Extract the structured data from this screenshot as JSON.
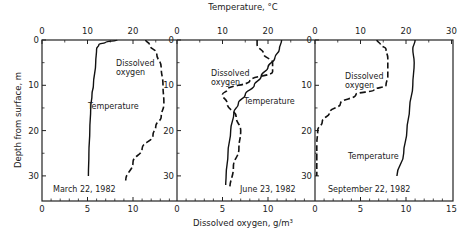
{
  "chart_data": {
    "type": "line",
    "title": "",
    "top_axis_label": "Temperature, °C",
    "bottom_axis_label": "Dissolved oxygen, g/m³",
    "ylabel": "Depth from surface, m",
    "y_ticks": [
      0,
      10,
      20,
      30
    ],
    "ylim": [
      0,
      35.5
    ],
    "y_inverted": true,
    "panels": [
      {
        "date": "March 22, 1982",
        "top_ticks": [
          "0",
          "10",
          "20"
        ],
        "bottom_ticks": [
          "0",
          "5",
          "10"
        ],
        "temperature_range": [
          0,
          30
        ],
        "oxygen_range": [
          0,
          15
        ],
        "series": [
          {
            "name": "Temperature",
            "style": "solid",
            "axis": "temperature",
            "depth": [
              0,
              0.5,
              1,
              2,
              5,
              10,
              12,
              15,
              20,
              25,
              30
            ],
            "values": [
              16.5,
              14,
              12.5,
              12,
              11.8,
              11.3,
              11,
              10.7,
              10.5,
              10.3,
              10.2
            ]
          },
          {
            "name": "Dissolved oxygen",
            "style": "dashed",
            "axis": "oxygen",
            "depth": [
              0,
              1,
              3,
              6,
              10,
              14,
              17,
              19,
              21,
              24,
              27,
              31
            ],
            "values": [
              11.4,
              11.8,
              12.6,
              13.1,
              13.3,
              13.4,
              13.1,
              12.5,
              12.2,
              11,
              10,
              9.2
            ]
          }
        ],
        "labels": [
          "Dissolved oxygen",
          "Temperature"
        ]
      },
      {
        "date": "June 23, 1982",
        "top_ticks": [
          "0",
          "10",
          "20"
        ],
        "bottom_ticks": [
          "0",
          "5",
          "10"
        ],
        "temperature_range": [
          0,
          30
        ],
        "oxygen_range": [
          0,
          15
        ],
        "series": [
          {
            "name": "Temperature",
            "style": "solid",
            "axis": "temperature",
            "depth": [
              0,
              2,
              4,
              6,
              8,
              10,
              12,
              14,
              16,
              20,
              25,
              30,
              32
            ],
            "values": [
              23,
              22.5,
              21.5,
              20,
              18.5,
              17,
              15,
              13.5,
              12.5,
              11.8,
              11.2,
              10.8,
              10.7
            ]
          },
          {
            "name": "Dissolved oxygen",
            "style": "dashed",
            "axis": "oxygen",
            "depth": [
              0,
              1,
              3,
              5,
              7,
              9,
              11,
              12,
              14,
              17,
              20,
              24,
              28,
              33
            ],
            "values": [
              8.8,
              8.8,
              9.5,
              10.5,
              10.5,
              8,
              5.5,
              5,
              5.5,
              6.5,
              7,
              6.8,
              6.2,
              5.8
            ]
          }
        ],
        "labels": [
          "Dissolved oxygen",
          "Temperature"
        ]
      },
      {
        "date": "September 22, 1982",
        "top_ticks": [
          "0",
          "10",
          "20",
          "30"
        ],
        "bottom_ticks": [
          "0",
          "5",
          "10",
          "15"
        ],
        "temperature_range": [
          0,
          30
        ],
        "oxygen_range": [
          0,
          15
        ],
        "series": [
          {
            "name": "Temperature",
            "style": "solid",
            "axis": "temperature",
            "depth": [
              0,
              2,
              5,
              10,
              15,
              20,
              25,
              30
            ],
            "values": [
              22,
              21.5,
              21.8,
              21.5,
              20.8,
              20.2,
              19.5,
              18
            ]
          },
          {
            "name": "Dissolved oxygen",
            "style": "dashed",
            "axis": "oxygen",
            "depth": [
              0,
              1,
              2,
              4,
              6,
              8,
              10,
              11,
              12,
              14,
              16,
              18,
              20,
              23,
              26,
              30
            ],
            "values": [
              6.8,
              7.2,
              7.8,
              8,
              8,
              8,
              7.8,
              6.5,
              4.5,
              2.8,
              1.6,
              0.8,
              0.3,
              0.2,
              0.2,
              0.2
            ]
          }
        ],
        "labels": [
          "Dissolved oxygen",
          "Temperature"
        ]
      }
    ],
    "legend": "none (curves labeled inline)",
    "grid": false
  },
  "texts": {
    "top_axis_label": "Temperature, °C",
    "bottom_axis_label": "Dissolved oxygen, g/m³",
    "y_axis_label": "Depth from surface, m",
    "do_label_line1": "Dissolved",
    "do_label_line2": "oxygen",
    "temp_label": "Temperature",
    "date_1": "March 22, 1982",
    "date_2": "June 23, 1982",
    "date_3": "September 22, 1982"
  }
}
